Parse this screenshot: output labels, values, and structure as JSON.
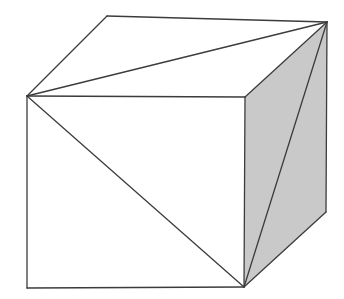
{
  "figure": {
    "background_color": "#ffffff",
    "canvas": {
      "width": 344,
      "height": 299
    },
    "colors": {
      "outline": "#3c3c3c",
      "face_light": "#ffffff",
      "face_shaded": "#c9c9c9",
      "background": "#ffffff"
    },
    "stroke_width": 1.3,
    "vertices": {
      "front_top_left": [
        27,
        96
      ],
      "front_top_right": [
        245,
        97
      ],
      "front_bottom_left": [
        27,
        288
      ],
      "front_bottom_right": [
        244,
        287
      ],
      "back_top_left": [
        107,
        16
      ],
      "back_top_right": [
        327,
        22
      ],
      "back_bottom_right": [
        326,
        212
      ]
    },
    "faces": [
      {
        "name": "top-face",
        "fill": "#ffffff",
        "points": "27,96 107,16 327,22 245,97",
        "diagonal": {
          "from": [
            27,
            96
          ],
          "to": [
            327,
            22
          ]
        }
      },
      {
        "name": "front-face",
        "fill": "#ffffff",
        "points": "27,96 245,97 244,287 27,288",
        "diagonal": {
          "from": [
            27,
            96
          ],
          "to": [
            244,
            287
          ]
        }
      },
      {
        "name": "right-face",
        "fill": "#c9c9c9",
        "points": "245,97 327,22 326,212 244,287",
        "diagonal": {
          "from": [
            327,
            22
          ],
          "to": [
            244,
            287
          ]
        }
      }
    ],
    "edges": [
      {
        "name": "front-top-edge",
        "from": [
          27,
          96
        ],
        "to": [
          245,
          97
        ]
      },
      {
        "name": "front-left-edge",
        "from": [
          27,
          96
        ],
        "to": [
          27,
          288
        ]
      },
      {
        "name": "front-bottom-edge",
        "from": [
          27,
          288
        ],
        "to": [
          244,
          287
        ]
      },
      {
        "name": "front-right-edge",
        "from": [
          245,
          97
        ],
        "to": [
          244,
          287
        ]
      },
      {
        "name": "top-back-left-edge",
        "from": [
          27,
          96
        ],
        "to": [
          107,
          16
        ]
      },
      {
        "name": "top-back-edge",
        "from": [
          107,
          16
        ],
        "to": [
          327,
          22
        ]
      },
      {
        "name": "top-right-edge",
        "from": [
          327,
          22
        ],
        "to": [
          245,
          97
        ]
      },
      {
        "name": "right-back-vertical-edge",
        "from": [
          327,
          22
        ],
        "to": [
          326,
          212
        ]
      },
      {
        "name": "right-bottom-edge",
        "from": [
          326,
          212
        ],
        "to": [
          244,
          287
        ]
      }
    ]
  }
}
